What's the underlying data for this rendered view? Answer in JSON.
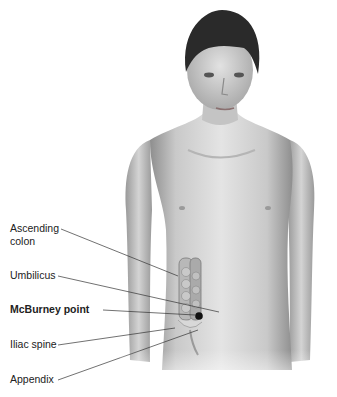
{
  "figure": {
    "labels": [
      {
        "id": "ascending-colon",
        "line1": "Ascending",
        "line2": "colon",
        "bold": false
      },
      {
        "id": "umbilicus",
        "line1": "Umbilicus",
        "bold": false
      },
      {
        "id": "mcburney-point",
        "line1": "McBurney point",
        "bold": true
      },
      {
        "id": "iliac-spine",
        "line1": "Iliac spine",
        "bold": false
      },
      {
        "id": "appendix",
        "line1": "Appendix",
        "bold": false
      }
    ],
    "colors": {
      "skin_light": "#e6e6e6",
      "skin_mid": "#bdbdbd",
      "skin_dark": "#8c8c8c",
      "hair": "#2a2a2a",
      "leader": "#333333",
      "marker": "#111111"
    }
  }
}
